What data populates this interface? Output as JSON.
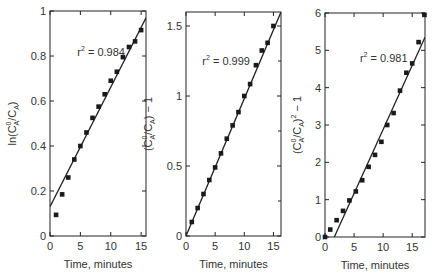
{
  "figure": {
    "background": "#ffffff",
    "ink_color": "#222222",
    "marker_color": "#1a1a1a"
  },
  "chart_data": [
    {
      "type": "scatter",
      "panel": "left",
      "title": "",
      "xlabel": "Time, minutes",
      "ylabel": "ln(C_A^0/C_A)",
      "ylabel_parts": {
        "pre": "ln(C",
        "sup": "0",
        "sub": "A",
        "mid": "/C",
        "sub2": "A",
        "post": ")"
      },
      "xlim": [
        0,
        15.8
      ],
      "ylim": [
        0,
        1
      ],
      "xticks": [
        0,
        5,
        10,
        15
      ],
      "yticks": [
        0,
        0.2,
        0.4,
        0.6,
        0.8,
        1
      ],
      "ytick_labels": [
        "0",
        "0.2",
        "0.4",
        "0.6",
        "0.8",
        "1"
      ],
      "annotation": {
        "text_prefix": "r",
        "sup": "2",
        "text_suffix": " = 0.984",
        "x": 4.5,
        "y": 0.8
      },
      "fit_line": {
        "x": [
          0,
          15.8
        ],
        "y": [
          0.13,
          0.97
        ]
      },
      "x": [
        1,
        2,
        3,
        4,
        5,
        6,
        7,
        8,
        9,
        10,
        11,
        12,
        13,
        14,
        15
      ],
      "y": [
        0.094,
        0.185,
        0.26,
        0.34,
        0.4,
        0.46,
        0.525,
        0.575,
        0.63,
        0.69,
        0.73,
        0.795,
        0.84,
        0.865,
        0.915
      ],
      "box": {
        "left": 50,
        "top": 11,
        "right": 146,
        "bottom": 236
      }
    },
    {
      "type": "scatter",
      "panel": "middle",
      "title": "",
      "xlabel": "Time, minutes",
      "ylabel": "(C_A^0/C_A) - 1",
      "ylabel_parts": {
        "pre": "(C",
        "sup": "0",
        "sub": "A",
        "mid": "/C",
        "sub2": "A",
        "post": ") − 1"
      },
      "xlim": [
        0,
        16.3
      ],
      "ylim": [
        0,
        1.6
      ],
      "xticks": [
        0,
        5,
        10,
        15
      ],
      "yticks": [
        0,
        0.5,
        1,
        1.5
      ],
      "ytick_labels": [
        "0",
        "0.5",
        "1",
        "1.5"
      ],
      "minor_yticks": [
        0.25,
        0.75,
        1.25
      ],
      "annotation": {
        "text_prefix": "r",
        "sup": "2",
        "text_suffix": " = 0.999",
        "x": 2.8,
        "y": 1.22
      },
      "fit_line": {
        "x": [
          0,
          16.3
        ],
        "y": [
          0,
          1.6
        ]
      },
      "x": [
        1,
        2,
        3,
        4,
        5,
        6,
        7,
        8,
        9,
        10,
        11,
        12,
        13,
        14,
        15
      ],
      "y": [
        0.1,
        0.2,
        0.3,
        0.4,
        0.49,
        0.59,
        0.695,
        0.79,
        0.885,
        1.0,
        1.085,
        1.22,
        1.325,
        1.38,
        1.5
      ],
      "box": {
        "left": 186,
        "top": 12,
        "right": 281,
        "bottom": 236
      }
    },
    {
      "type": "scatter",
      "panel": "right",
      "title": "",
      "xlabel": "Time, minutes",
      "ylabel": "(C_A^0/C_A)^2 - 1",
      "ylabel_parts": {
        "pre": "(C",
        "sup": "0",
        "sub": "A",
        "mid": "/C",
        "sub2": "A",
        "post": ")",
        "sup2": "2",
        "post2": " − 1"
      },
      "xlim": [
        0,
        17.2
      ],
      "ylim": [
        0,
        6
      ],
      "xticks": [
        0,
        5,
        10,
        15
      ],
      "yticks": [
        0,
        1,
        2,
        3,
        4,
        5,
        6
      ],
      "ytick_labels": [
        "0",
        "1",
        "2",
        "3",
        "4",
        "5",
        "6"
      ],
      "annotation": {
        "text_prefix": "r",
        "sup": "2",
        "text_suffix": " = 0.981",
        "x": 6.0,
        "y": 4.7
      },
      "fit_line": {
        "x": [
          1.6,
          17.2
        ],
        "y": [
          0,
          5.35
        ]
      },
      "x": [
        0,
        0.9,
        2.0,
        3.1,
        4.2,
        5.3,
        6.4,
        7.5,
        8.6,
        9.7,
        10.7,
        11.8,
        12.9,
        14.0,
        15.0,
        16.1,
        17.1
      ],
      "y": [
        0,
        0.2,
        0.45,
        0.7,
        0.98,
        1.22,
        1.52,
        1.88,
        2.2,
        2.55,
        3.0,
        3.32,
        3.92,
        4.4,
        4.65,
        5.22,
        5.95
      ],
      "box": {
        "left": 325,
        "top": 13,
        "right": 425,
        "bottom": 237
      }
    }
  ]
}
